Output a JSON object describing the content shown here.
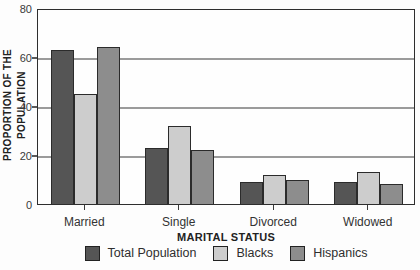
{
  "colors": {
    "total_population": "#555555",
    "blacks": "#cdcdcd",
    "hispanics": "#8d8d8d",
    "bar_border": "#2b2b2b",
    "gridline": "#9b9b9b",
    "frame": "#2e2e2e",
    "text": "#2e2e2e"
  },
  "chart_data": {
    "type": "bar",
    "title": "",
    "xlabel": "MARITAL STATUS",
    "ylabel": "PROPORTION OF THE POPULATION",
    "categories": [
      "Married",
      "Single",
      "Divorced",
      "Widowed"
    ],
    "series": [
      {
        "name": "Total Population",
        "color": "#555555",
        "values": [
          63,
          23,
          9,
          9
        ]
      },
      {
        "name": "Blacks",
        "color": "#cdcdcd",
        "values": [
          45,
          32,
          12,
          13
        ]
      },
      {
        "name": "Hispanics",
        "color": "#8d8d8d",
        "values": [
          64,
          22,
          10,
          8
        ]
      }
    ],
    "ylim": [
      0,
      80
    ],
    "yticks": [
      0,
      20,
      40,
      60,
      80
    ],
    "grid": "horizontal",
    "legend_position": "bottom"
  }
}
